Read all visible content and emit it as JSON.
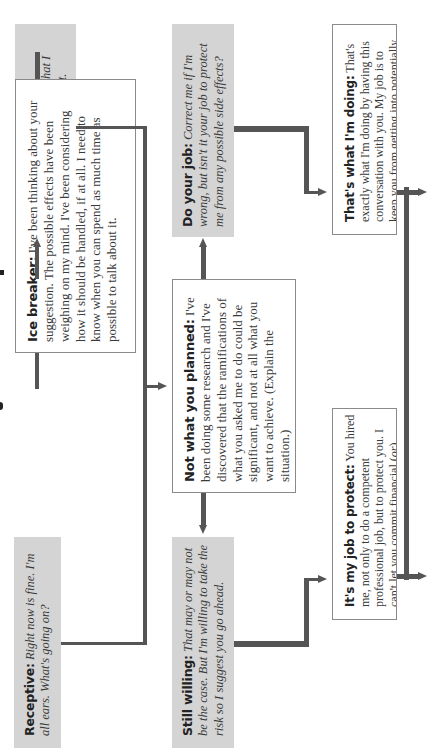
{
  "diagram": {
    "title_fragment": "",
    "nodes": {
      "unreceptive": {
        "label": "Unreceptive:",
        "text": "Aren't you overreacting? I didn't think what I suggested was that significant.",
        "style": "gray-italic"
      },
      "ice_breaker": {
        "label": "Ice breaker:",
        "text": "I've been thinking about your suggestion. The possible effects have been weighing on my mind. I've been considering how it should be handled, if at all. I need to know when you can spend as much time as possible to talk about it.",
        "style": "white-roman"
      },
      "receptive": {
        "label": "Receptive:",
        "text": "Right now is fine. I'm all ears. What's going on?",
        "style": "gray-italic"
      },
      "do_your_job": {
        "label": "Do your job:",
        "text": "Correct me if I'm wrong, but isn't it your job to protect me from any possible side effects?",
        "style": "gray-italic"
      },
      "not_what_you_planned": {
        "label": "Not what you planned:",
        "text": "I've been doing some research and I've discovered that the ramifications of what you asked me to do could be significant, and not at all what you want to achieve. (Explain the situation.)",
        "style": "white-roman"
      },
      "still_willing": {
        "label": "Still willing:",
        "text": "That may or may not be the case. But I'm willing to take the risk so I suggest you go ahead.",
        "style": "gray-italic"
      },
      "thats_what_im_doing": {
        "label": "That's what I'm doing:",
        "text": "That's exactly what I'm doing by having this conversation with you. My job is to keep you from getting into potentially dangerous situations.",
        "style": "white-roman"
      },
      "its_my_job_to_protect": {
        "label": "It's my job to protect:",
        "text_pre": "You hired me, not only to do a competent professional job, but to protect you. I can't let you commit financial (",
        "text_or1": "or",
        "text_mid": ") professional (",
        "text_or2": "or",
        "text_post": ") legal suicide.",
        "style": "white-roman"
      }
    },
    "edges": [
      {
        "from": "ice_breaker",
        "to": "unreceptive"
      },
      {
        "from": "ice_breaker",
        "to": "receptive"
      },
      {
        "from": "unreceptive",
        "to": "not_what_you_planned"
      },
      {
        "from": "receptive",
        "to": "not_what_you_planned"
      },
      {
        "from": "not_what_you_planned",
        "to": "do_your_job"
      },
      {
        "from": "not_what_you_planned",
        "to": "still_willing"
      },
      {
        "from": "do_your_job",
        "to": "thats_what_im_doing"
      },
      {
        "from": "still_willing",
        "to": "its_my_job_to_protect"
      },
      {
        "from": "thats_what_im_doing",
        "to": "next-right"
      },
      {
        "from": "its_my_job_to_protect",
        "to": "next-right"
      }
    ],
    "colors": {
      "gray_box": "#d4d4d4",
      "connector": "#555555",
      "border": "#8a8a8a",
      "text": "#3a3a3a"
    }
  }
}
